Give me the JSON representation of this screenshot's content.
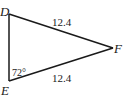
{
  "diagram": {
    "type": "triangle",
    "vertices": {
      "D": {
        "label": "D"
      },
      "E": {
        "label": "E"
      },
      "F": {
        "label": "F"
      }
    },
    "sides": {
      "DF": {
        "label": "12.4"
      },
      "EF": {
        "label": "12.4"
      }
    },
    "angles": {
      "E": {
        "label": "72°"
      }
    },
    "stroke_color": "#1a1a1a"
  }
}
